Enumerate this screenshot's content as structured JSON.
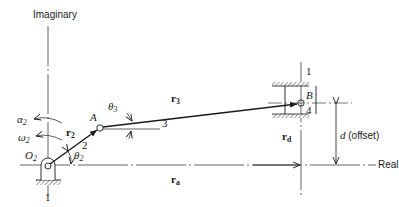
{
  "diagram": {
    "type": "offset-slider-crank-mechanism",
    "axes": {
      "imaginary_label": "Imaginary",
      "real_label": "Real"
    },
    "ground": {
      "left_link_number": "1",
      "slider_guide_link_number": "1"
    },
    "joints": {
      "crank_pivot": "O",
      "crank_pivot_sub": "2",
      "crank_coupler": "A",
      "slider_pin": "B"
    },
    "links": {
      "crank_number": "2",
      "coupler_number": "3",
      "slider_number": "4"
    },
    "vectors": {
      "r2": "r",
      "r2_sub": "2",
      "r3": "r",
      "r3_sub": "3",
      "ra": "r",
      "ra_sub": "a",
      "rd": "r",
      "rd_sub": "d"
    },
    "angles": {
      "theta2": "θ",
      "theta2_sub": "2",
      "theta3": "θ",
      "theta3_sub": "3"
    },
    "kinematics": {
      "alpha2": "α",
      "alpha2_sub": "2",
      "omega2": "ω",
      "omega2_sub": "2"
    },
    "offset": {
      "symbol": "d",
      "label": "(offset)"
    },
    "colors": {
      "line": "#1a1a1a",
      "axis": "#555555",
      "hatch": "#888888"
    }
  }
}
